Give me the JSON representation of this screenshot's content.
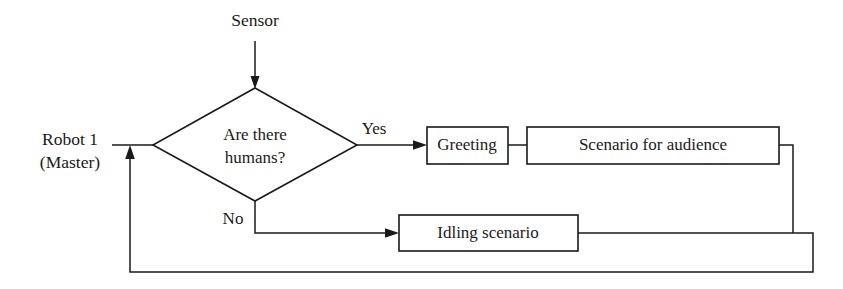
{
  "diagram": {
    "type": "flowchart",
    "background_color": "#ffffff",
    "line_color": "#1a1a1a",
    "text_color": "#1a1a1a",
    "external_labels": {
      "sensor": "Sensor",
      "actor_line1": "Robot 1",
      "actor_line2": "(Master)"
    },
    "decision": {
      "line1": "Are there",
      "line2": "humans?"
    },
    "edge_labels": {
      "yes": "Yes",
      "no": "No"
    },
    "processes": {
      "greeting": "Greeting",
      "scenario_for_audience": "Scenario for audience",
      "idling_scenario": "Idling scenario"
    }
  }
}
